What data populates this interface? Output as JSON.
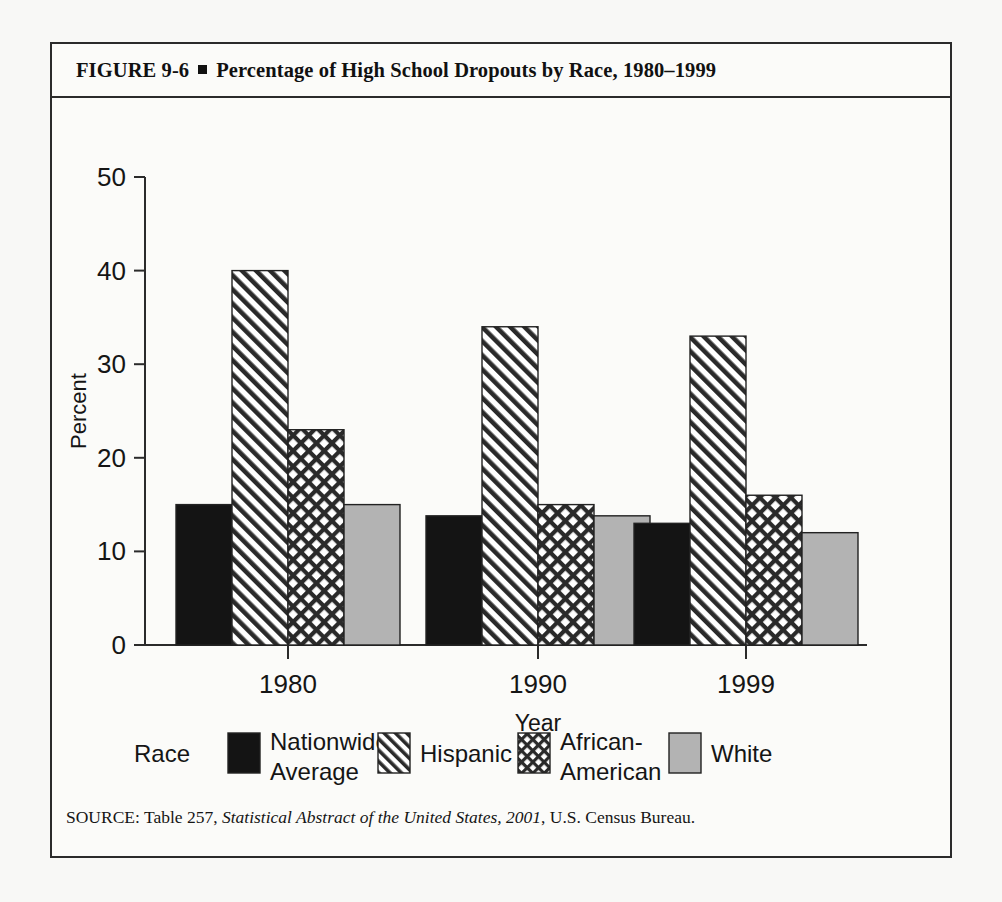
{
  "figure": {
    "label": "FIGURE  9-6",
    "bullet": "square-bullet",
    "title": "Percentage of High School Dropouts by Race, 1980–1999",
    "source_prefix": "SOURCE: Table 257, ",
    "source_italic": "Statistical Abstract of the United States, 2001",
    "source_suffix": ", U.S. Census Bureau."
  },
  "legend": {
    "title": "Race",
    "entries": [
      {
        "label_line1": "Nationwide",
        "label_line2": "Average",
        "pattern": "solid-black",
        "color": "#141414"
      },
      {
        "label_line1": "Hispanic",
        "label_line2": "",
        "pattern": "diagonal-hatch",
        "color": "#2a2a2a"
      },
      {
        "label_line1": "African-",
        "label_line2": "American",
        "pattern": "cross-hatch",
        "color": "#2a2a2a"
      },
      {
        "label_line1": "White",
        "label_line2": "",
        "pattern": "solid-gray",
        "color": "#b3b3b3"
      }
    ]
  },
  "chart_data": {
    "type": "bar",
    "title": "Percentage of High School Dropouts by Race, 1980–1999",
    "xlabel": "Year",
    "ylabel": "Percent",
    "categories": [
      "1980",
      "1990",
      "1999"
    ],
    "ylim": [
      0,
      50
    ],
    "yticks": [
      0,
      10,
      20,
      30,
      40,
      50
    ],
    "ytick_labels": [
      "0",
      "10",
      "20",
      "30",
      "40",
      "50"
    ],
    "grid": false,
    "legend_position": "bottom",
    "series": [
      {
        "name": "Nationwide Average",
        "pattern": "solid-black",
        "values": [
          15,
          13.8,
          13
        ]
      },
      {
        "name": "Hispanic",
        "pattern": "diagonal-hatch",
        "values": [
          40,
          34,
          33
        ]
      },
      {
        "name": "African-American",
        "pattern": "cross-hatch",
        "values": [
          23,
          15,
          16
        ]
      },
      {
        "name": "White",
        "pattern": "solid-gray",
        "values": [
          15,
          13.8,
          12
        ]
      }
    ]
  },
  "colors": {
    "axis": "#2b2b2b",
    "frame": "#2b2b2b",
    "black_bar": "#141414",
    "gray_bar": "#b3b3b3",
    "hatch_line": "#2a2a2a",
    "page_background": "#f8f8f6",
    "panel_background": "#fbfbf9"
  }
}
